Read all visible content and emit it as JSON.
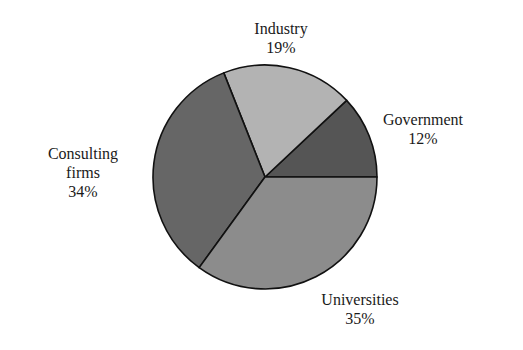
{
  "chart_data": {
    "type": "pie",
    "title": "",
    "categories": [
      "Government",
      "Industry",
      "Consulting firms",
      "Universities"
    ],
    "values": [
      12,
      19,
      34,
      35
    ],
    "unit": "%",
    "start_angle_deg": 0,
    "direction": "counterclockwise",
    "colors": [
      "#555555",
      "#b3b3b3",
      "#666666",
      "#8c8c8c"
    ],
    "legend": "none (direct labels)"
  },
  "labels": {
    "government": {
      "name": "Government",
      "pct": "12%"
    },
    "industry": {
      "name": "Industry",
      "pct": "19%"
    },
    "consulting": {
      "name1": "Consulting",
      "name2": "firms",
      "pct": "34%"
    },
    "universities": {
      "name": "Universities",
      "pct": "35%"
    }
  }
}
